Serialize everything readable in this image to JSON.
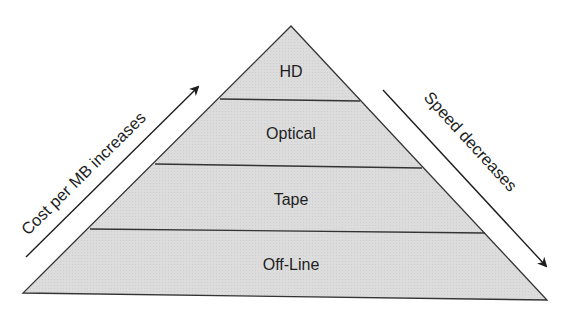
{
  "diagram": {
    "type": "storage-hierarchy-pyramid",
    "layers": [
      {
        "label": "HD"
      },
      {
        "label": "Optical"
      },
      {
        "label": "Tape"
      },
      {
        "label": "Off-Line"
      }
    ],
    "left_arrow": {
      "label": "Cost per MB increases",
      "direction": "up"
    },
    "right_arrow": {
      "label": "Speed decreases",
      "direction": "down"
    },
    "colors": {
      "fill": "#dcdcdc",
      "stroke": "#333333",
      "text": "#1e1e1e"
    }
  }
}
